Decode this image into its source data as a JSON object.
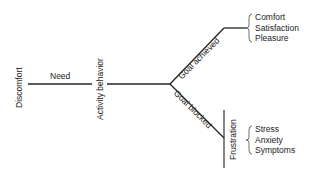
{
  "diagram": {
    "nodes": {
      "discomfort": "Discomfort",
      "need": "Need",
      "activity": "Activity behavior",
      "goal_achieved": "Goal achieved",
      "goal_blocked": "Goal blocked",
      "frustration": "Frustration"
    },
    "achieved_outcomes": [
      "Comfort",
      "Satisfaction",
      "Pleasure"
    ],
    "blocked_outcomes": [
      "Stress",
      "Anxiety",
      "Symptoms"
    ],
    "colors": {
      "line": "#222222",
      "text": "#222222",
      "background": "#ffffff"
    }
  }
}
